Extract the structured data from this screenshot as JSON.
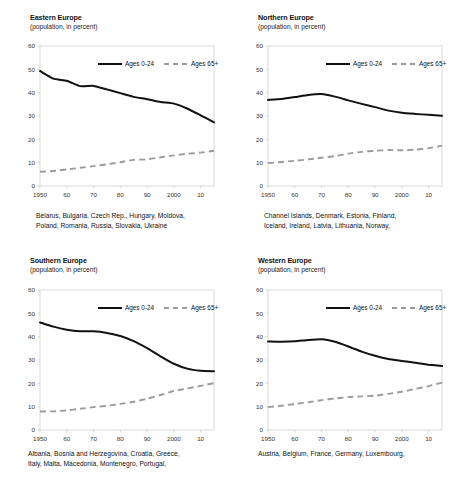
{
  "figure": {
    "legend": {
      "young_label": "Ages 0-24",
      "old_label": "Ages 65+"
    },
    "subtitle": "(population, in percent)",
    "colors": {
      "young_line": "#111111",
      "old_line": "#9b9b9b",
      "frame": "#c9c9c9",
      "background": "#ffffff"
    }
  },
  "chart_data": [
    {
      "type": "line",
      "title": "Eastern Europe",
      "subtitle": "(population, in percent)",
      "xlabel": "",
      "ylabel": "",
      "ylim": [
        0,
        60
      ],
      "xlim": [
        1950,
        2015
      ],
      "yticks": [
        0,
        10,
        20,
        30,
        40,
        50,
        60
      ],
      "xticks": [
        1950,
        1960,
        1970,
        1980,
        1990,
        2000,
        2010
      ],
      "xticklabels": [
        "1950",
        "60",
        "70",
        "80",
        "90",
        "2000",
        "10"
      ],
      "grid": false,
      "legend_position": "top-right-inside",
      "caption": "Belarus, Bulgaria, Czech Rep., Hungary, Moldova,\nPoland, Romania, Russia, Slovakia, Ukraine",
      "x": [
        1950,
        1955,
        1960,
        1965,
        1970,
        1975,
        1980,
        1985,
        1990,
        1995,
        2000,
        2005,
        2010,
        2015
      ],
      "series": [
        {
          "name": "Ages 0-24",
          "values": [
            49.3,
            46.0,
            45.1,
            42.8,
            42.9,
            41.4,
            39.8,
            38.2,
            37.2,
            36.0,
            35.3,
            33.2,
            30.3,
            27.3
          ]
        },
        {
          "name": "Ages 65+",
          "values": [
            6.1,
            6.4,
            7.1,
            7.8,
            8.5,
            9.3,
            10.2,
            11.2,
            11.4,
            12.3,
            13.1,
            13.8,
            14.3,
            15.1
          ]
        }
      ]
    },
    {
      "type": "line",
      "title": "Northern Europe",
      "subtitle": "(population, in percent)",
      "xlabel": "",
      "ylabel": "",
      "ylim": [
        0,
        60
      ],
      "xlim": [
        1950,
        2015
      ],
      "yticks": [
        0,
        10,
        20,
        30,
        40,
        50,
        60
      ],
      "xticks": [
        1950,
        1960,
        1970,
        1980,
        1990,
        2000,
        2010
      ],
      "xticklabels": [
        "1950",
        "60",
        "70",
        "80",
        "90",
        "2000",
        "10"
      ],
      "grid": false,
      "legend_position": "top-right-inside",
      "caption": "Channel Islands, Denmark, Estonia, Finland,\nIceland, Ireland, Latvia, Lithuania, Norway,",
      "x": [
        1950,
        1955,
        1960,
        1965,
        1970,
        1975,
        1980,
        1985,
        1990,
        1995,
        2000,
        2005,
        2010,
        2015
      ],
      "series": [
        {
          "name": "Ages 0-24",
          "values": [
            36.9,
            37.3,
            38.1,
            39.0,
            39.4,
            38.3,
            36.7,
            35.2,
            33.8,
            32.3,
            31.4,
            30.9,
            30.5,
            30.1
          ]
        },
        {
          "name": "Ages 65+",
          "values": [
            9.8,
            10.3,
            10.8,
            11.4,
            12.1,
            12.8,
            13.9,
            14.6,
            15.1,
            15.4,
            15.3,
            15.6,
            16.2,
            17.3
          ]
        }
      ]
    },
    {
      "type": "line",
      "title": "Southern Europe",
      "subtitle": "(population, in percent)",
      "xlabel": "",
      "ylabel": "",
      "ylim": [
        0,
        60
      ],
      "xlim": [
        1950,
        2015
      ],
      "yticks": [
        0,
        10,
        20,
        30,
        40,
        50,
        60
      ],
      "xticks": [
        1950,
        1960,
        1970,
        1980,
        1990,
        2000,
        2010
      ],
      "xticklabels": [
        "1950",
        "60",
        "70",
        "80",
        "90",
        "2000",
        "10"
      ],
      "grid": false,
      "legend_position": "top-right-inside",
      "caption": "Albania, Bosnia and Herzegovina, Croatia, Greece,\nItaly, Malta, Macedonia, Montenegro, Portugal,",
      "x": [
        1950,
        1955,
        1960,
        1965,
        1970,
        1975,
        1980,
        1985,
        1990,
        1995,
        2000,
        2005,
        2010,
        2015
      ],
      "series": [
        {
          "name": "Ages 0-24",
          "values": [
            46.1,
            44.3,
            43.0,
            42.3,
            42.3,
            41.6,
            40.3,
            38.1,
            35.1,
            31.6,
            28.4,
            26.3,
            25.4,
            25.2
          ]
        },
        {
          "name": "Ages 65+",
          "values": [
            7.9,
            8.0,
            8.4,
            9.1,
            9.8,
            10.4,
            11.2,
            12.1,
            13.4,
            15.0,
            16.7,
            17.8,
            18.9,
            20.1
          ]
        }
      ]
    },
    {
      "type": "line",
      "title": "Western Europe",
      "subtitle": "(population, in percent)",
      "xlabel": "",
      "ylabel": "",
      "ylim": [
        0,
        60
      ],
      "xlim": [
        1950,
        2015
      ],
      "yticks": [
        0,
        10,
        20,
        30,
        40,
        50,
        60
      ],
      "xticks": [
        1950,
        1960,
        1970,
        1980,
        1990,
        2000,
        2010
      ],
      "xticklabels": [
        "1950",
        "60",
        "70",
        "80",
        "90",
        "2000",
        "10"
      ],
      "grid": false,
      "legend_position": "top-right-inside",
      "caption": "Austria, Belgium, France, Germany, Luxembourg,",
      "x": [
        1950,
        1955,
        1960,
        1965,
        1970,
        1975,
        1980,
        1985,
        1990,
        1995,
        2000,
        2005,
        2010,
        2015
      ],
      "series": [
        {
          "name": "Ages 0-24",
          "values": [
            37.9,
            37.8,
            38.0,
            38.6,
            38.9,
            37.8,
            35.8,
            33.6,
            31.8,
            30.4,
            29.6,
            28.8,
            28.0,
            27.4
          ]
        },
        {
          "name": "Ages 65+",
          "values": [
            9.8,
            10.4,
            11.1,
            11.9,
            12.8,
            13.5,
            14.1,
            14.4,
            14.7,
            15.5,
            16.4,
            17.6,
            18.8,
            20.3
          ]
        }
      ]
    }
  ]
}
